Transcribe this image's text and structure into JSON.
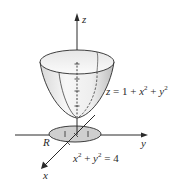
{
  "figure": {
    "type": "3d-surface-diagram"
  },
  "axes": {
    "x_label": "x",
    "y_label": "y",
    "z_label": "z"
  },
  "surface": {
    "equation": {
      "lhs": "z",
      "eq": " = 1 + ",
      "t1": "x",
      "p1": "2",
      "plus": " + ",
      "t2": "y",
      "p2": "2"
    }
  },
  "region": {
    "label": "R",
    "equation": {
      "t1": "x",
      "p1": "2",
      "plus": " + ",
      "t2": "y",
      "p2": "2",
      "rest": " = 4"
    }
  },
  "colors": {
    "line": "#2a2a2a",
    "surface_light": "#f3f3f3",
    "surface_shade": "#c9c9c9",
    "disk_fill": "#cfcfcf"
  }
}
